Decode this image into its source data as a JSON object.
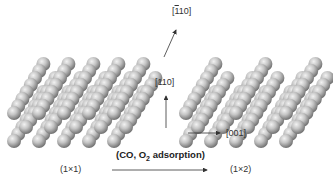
{
  "figure": {
    "left_structure": {
      "label": "(1×1)"
    },
    "right_structure": {
      "label": "(1×2)"
    },
    "process": {
      "label_prefix": "(CO, O",
      "label_sub": "2",
      "label_suffix": " adsorption)"
    },
    "axes": {
      "top": {
        "prefix": "[",
        "overbar": "1",
        "rest": "10]"
      },
      "vertical": "[110]",
      "horizontal": "[001]"
    },
    "colors": {
      "sphere_light": "#e6e6e6",
      "sphere_mid": "#b0b0b0",
      "sphere_dark": "#6e6e6e",
      "text": "#333333"
    }
  }
}
